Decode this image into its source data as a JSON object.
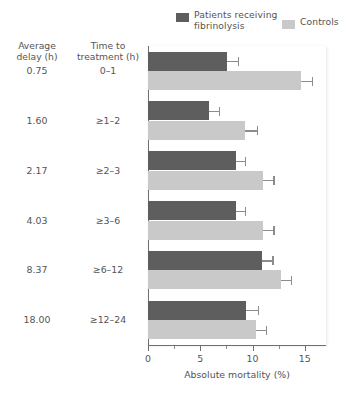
{
  "legend": {
    "entries": [
      {
        "label": "Patients receiving\nfibrinolysis",
        "color": "#5e5e5e",
        "name": "series-fibrinolysis"
      },
      {
        "label": "Controls",
        "color": "#c9c9c9",
        "name": "series-controls"
      }
    ]
  },
  "columns": {
    "average_delay_header": "Average\ndelay (h)",
    "time_to_treatment_header": "Time to\ntreatment (h)"
  },
  "rows": [
    {
      "average_delay": "0.75",
      "time_to_treatment": "0–1"
    },
    {
      "average_delay": "1.60",
      "time_to_treatment": "≥1–2"
    },
    {
      "average_delay": "2.17",
      "time_to_treatment": "≥2–3"
    },
    {
      "average_delay": "4.03",
      "time_to_treatment": "≥3–6"
    },
    {
      "average_delay": "8.37",
      "time_to_treatment": "≥6–12"
    },
    {
      "average_delay": "18.00",
      "time_to_treatment": "≥12–24"
    }
  ],
  "axis": {
    "tick_labels": [
      "0",
      "5",
      "10",
      "15"
    ],
    "tick_values": [
      0,
      5,
      10,
      15
    ],
    "minor_tick_values": [
      2.5,
      7.5,
      12.5,
      17.5
    ],
    "xlabel": "Absolute mortality (%)",
    "xmin": 0,
    "xmax": 17
  },
  "chart_data": {
    "type": "bar",
    "orientation": "horizontal",
    "title": "",
    "xlabel": "Absolute mortality (%)",
    "ylabel": "",
    "xlim": [
      0,
      17
    ],
    "grid": false,
    "legend_position": "top-right",
    "categories": [
      "0–1",
      "≥1–2",
      "≥2–3",
      "≥3–6",
      "≥6–12",
      "≥12–24"
    ],
    "category_average_delay_h": [
      0.75,
      1.6,
      2.17,
      4.03,
      8.37,
      18.0
    ],
    "series": [
      {
        "name": "Patients receiving fibrinolysis",
        "color": "#5e5e5e",
        "values": [
          7.6,
          5.8,
          8.4,
          8.4,
          10.9,
          9.4
        ],
        "errors": [
          1.0,
          1.0,
          0.9,
          0.9,
          1.0,
          1.1
        ]
      },
      {
        "name": "Controls",
        "color": "#c9c9c9",
        "values": [
          14.6,
          9.3,
          11.0,
          11.0,
          12.7,
          10.3
        ],
        "errors": [
          1.1,
          1.1,
          1.0,
          1.0,
          1.0,
          1.0
        ]
      }
    ]
  }
}
